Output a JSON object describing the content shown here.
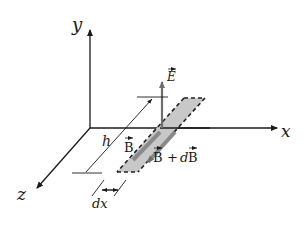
{
  "diagram": {
    "axes": {
      "x_label": "x",
      "y_label": "y",
      "z_label": "z"
    },
    "vectors": {
      "E_label": "E",
      "B_label": "B",
      "B_plus_dB_label_base": "B",
      "B_plus_dB_operator": "+",
      "B_plus_dB_d": "d",
      "B_plus_dB_B": "B"
    },
    "dimensions": {
      "height_label": "h",
      "width_label": "dx"
    },
    "colors": {
      "axis": "#1a1a1a",
      "strip_fill": "#c8c8c8",
      "arrow_gray": "#6e6e6e",
      "dashed_edge": "#222222"
    }
  }
}
